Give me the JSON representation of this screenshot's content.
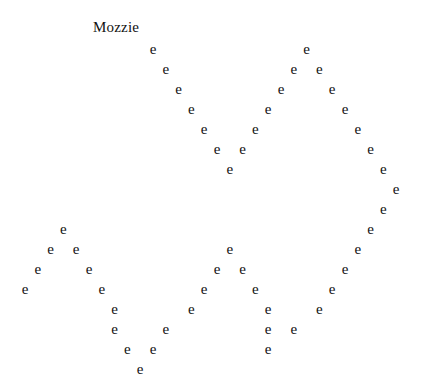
{
  "title": "Mozzie",
  "glyph": "e",
  "grid": {
    "origin_x": 25,
    "origin_y": 50,
    "step_x": 12.8,
    "step_y": 20
  },
  "points": [
    [
      0,
      10
    ],
    [
      0,
      22
    ],
    [
      1,
      11
    ],
    [
      1,
      21
    ],
    [
      1,
      23
    ],
    [
      2,
      12
    ],
    [
      2,
      20
    ],
    [
      2,
      24
    ],
    [
      3,
      13
    ],
    [
      3,
      19
    ],
    [
      3,
      25
    ],
    [
      4,
      14
    ],
    [
      4,
      18
    ],
    [
      4,
      26
    ],
    [
      5,
      15
    ],
    [
      5,
      17
    ],
    [
      5,
      27
    ],
    [
      6,
      16
    ],
    [
      6,
      28
    ],
    [
      7,
      29
    ],
    [
      8,
      28
    ],
    [
      9,
      3
    ],
    [
      9,
      27
    ],
    [
      10,
      2
    ],
    [
      10,
      4
    ],
    [
      10,
      16
    ],
    [
      10,
      26
    ],
    [
      11,
      1
    ],
    [
      11,
      5
    ],
    [
      11,
      15
    ],
    [
      11,
      17
    ],
    [
      11,
      25
    ],
    [
      12,
      0
    ],
    [
      12,
      6
    ],
    [
      12,
      14
    ],
    [
      12,
      18
    ],
    [
      12,
      24
    ],
    [
      13,
      7
    ],
    [
      13,
      13
    ],
    [
      13,
      19
    ],
    [
      13,
      23
    ],
    [
      14,
      7
    ],
    [
      14,
      11
    ],
    [
      14,
      19
    ],
    [
      14,
      21
    ],
    [
      15,
      8
    ],
    [
      15,
      10
    ],
    [
      15,
      19
    ],
    [
      16,
      9
    ]
  ]
}
